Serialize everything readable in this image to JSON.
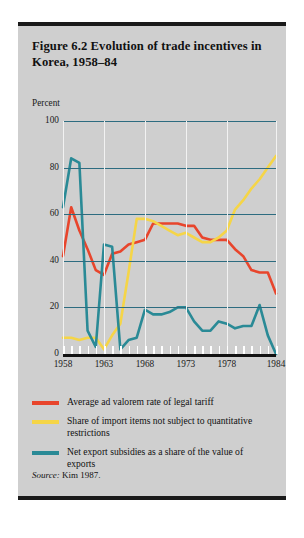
{
  "figure": {
    "title": "Figure 6.2  Evolution of trade incentives in Korea, 1958–84",
    "source_label": "Source:",
    "source_text": "Kim 1987."
  },
  "colors": {
    "card_background": "#cfcfcf",
    "rule": "#1a1a1a",
    "gridline_horizontal": "#2d6c80",
    "gridline_vertical": "#f2f2f2",
    "axis": "#111111",
    "tariff_red": "#e8452c",
    "imports_yellow": "#f5d547",
    "subsidies_teal": "#2a8a96"
  },
  "legend": {
    "items": [
      {
        "color_key": "tariff_red",
        "color": "#e8452c",
        "label": "Average ad valorem rate of legal tariff"
      },
      {
        "color_key": "imports_yellow",
        "color": "#f5d547",
        "label": "Share of import items not subject to quantitative restrictions"
      },
      {
        "color_key": "subsidies_teal",
        "color": "#2a8a96",
        "label": "Net export subsidies as a share of the value of exports"
      }
    ]
  },
  "chart_data": {
    "type": "line",
    "title": "Figure 6.2  Evolution of trade incentives in Korea, 1958–84",
    "xlabel": "",
    "ylabel": "Percent",
    "ylim": [
      0,
      100
    ],
    "xlim": [
      1958,
      1984
    ],
    "grid": true,
    "legend_position": "below",
    "ytick_labels": [
      "100",
      "80",
      "60",
      "40",
      "20",
      "0"
    ],
    "ytick_values": [
      100,
      80,
      60,
      40,
      20,
      0
    ],
    "xtick_labels": [
      "1958",
      "1963",
      "1968",
      "1973",
      "1978",
      "1984"
    ],
    "xtick_values": [
      1958,
      1963,
      1968,
      1973,
      1978,
      1984
    ],
    "x": [
      1958,
      1959,
      1960,
      1961,
      1962,
      1963,
      1964,
      1965,
      1966,
      1967,
      1968,
      1969,
      1970,
      1971,
      1972,
      1973,
      1974,
      1975,
      1976,
      1977,
      1978,
      1979,
      1980,
      1981,
      1982,
      1983,
      1984
    ],
    "series": [
      {
        "name": "Average ad valorem rate of legal tariff",
        "color": "#e8452c",
        "values": [
          42,
          63,
          53,
          45,
          36,
          34,
          43,
          44,
          47,
          48,
          49,
          56,
          56,
          56,
          56,
          55,
          55,
          50,
          49,
          49,
          49,
          45,
          42,
          36,
          35,
          35,
          26
        ]
      },
      {
        "name": "Share of import items not subject to quantitative restrictions",
        "color": "#f5d547",
        "values": [
          7,
          7,
          6,
          7,
          7,
          2,
          8,
          13,
          35,
          58,
          58,
          57,
          55,
          53,
          51,
          52,
          50,
          48,
          48,
          50,
          53,
          62,
          66,
          71,
          75,
          80,
          85
        ]
      },
      {
        "name": "Net export subsidies as a share of the value of exports",
        "color": "#2a8a96",
        "values": [
          63,
          84,
          82,
          10,
          3,
          47,
          46,
          2,
          6,
          7,
          19,
          17,
          17,
          18,
          20,
          20,
          14,
          10,
          10,
          14,
          13,
          11,
          12,
          12,
          21,
          8,
          0
        ]
      }
    ]
  }
}
